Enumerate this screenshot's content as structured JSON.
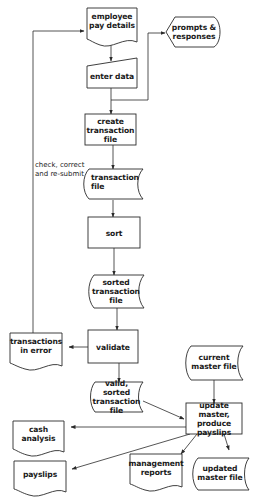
{
  "diagram": {
    "type": "system flowchart",
    "title": "",
    "colors": {
      "stroke": "#2a2a2a",
      "text": "#1a1a1a",
      "background": "#ffffff"
    },
    "nodes": [
      {
        "id": "employee_pay_details",
        "shape": "document",
        "label": "employee pay details"
      },
      {
        "id": "prompts_responses",
        "shape": "display",
        "label": "prompts & responses"
      },
      {
        "id": "enter_data",
        "shape": "manual-input",
        "label": "enter data"
      },
      {
        "id": "create_transaction_file",
        "shape": "process",
        "label": "create transaction file"
      },
      {
        "id": "transaction_file",
        "shape": "stored-data",
        "label": "transaction file"
      },
      {
        "id": "sort",
        "shape": "process",
        "label": "sort"
      },
      {
        "id": "sorted_transaction_file",
        "shape": "stored-data",
        "label": "sorted transaction file"
      },
      {
        "id": "validate",
        "shape": "process",
        "label": "validate"
      },
      {
        "id": "transactions_in_error",
        "shape": "document",
        "label": "transactions in error"
      },
      {
        "id": "current_master_file",
        "shape": "stored-data",
        "label": "current master file"
      },
      {
        "id": "valid_sorted_transaction_file",
        "shape": "stored-data",
        "label": "valid, sorted transaction file"
      },
      {
        "id": "update_master",
        "shape": "process",
        "label": "update master, produce payslips"
      },
      {
        "id": "cash_analysis",
        "shape": "document",
        "label": "cash analysis"
      },
      {
        "id": "payslips",
        "shape": "document",
        "label": "payslips"
      },
      {
        "id": "management_reports",
        "shape": "document",
        "label": "management reports"
      },
      {
        "id": "updated_master_file",
        "shape": "stored-data",
        "label": "updated master file"
      }
    ],
    "edges": [
      {
        "from": "employee_pay_details",
        "to": "enter_data"
      },
      {
        "from": "enter_data",
        "to": "create_transaction_file"
      },
      {
        "from": "create_transaction_file",
        "to": "prompts_responses"
      },
      {
        "from": "create_transaction_file",
        "to": "transaction_file"
      },
      {
        "from": "transaction_file",
        "to": "sort"
      },
      {
        "from": "sort",
        "to": "sorted_transaction_file"
      },
      {
        "from": "sorted_transaction_file",
        "to": "validate"
      },
      {
        "from": "validate",
        "to": "transactions_in_error"
      },
      {
        "from": "validate",
        "to": "valid_sorted_transaction_file"
      },
      {
        "from": "transactions_in_error",
        "to": "employee_pay_details",
        "label": "check, correct and re-submit"
      },
      {
        "from": "valid_sorted_transaction_file",
        "to": "update_master"
      },
      {
        "from": "current_master_file",
        "to": "update_master"
      },
      {
        "from": "update_master",
        "to": "cash_analysis"
      },
      {
        "from": "update_master",
        "to": "payslips"
      },
      {
        "from": "update_master",
        "to": "management_reports"
      },
      {
        "from": "update_master",
        "to": "updated_master_file"
      }
    ]
  },
  "labels": {
    "employee_pay_details": [
      "employee",
      "pay details"
    ],
    "prompts_responses": [
      "prompts &",
      "responses"
    ],
    "enter_data": "enter data",
    "create_transaction_file": [
      "create",
      "transaction",
      "file"
    ],
    "transaction_file": [
      "transaction",
      "file"
    ],
    "sort": "sort",
    "sorted_transaction_file": [
      "sorted",
      "transaction",
      "file"
    ],
    "validate": "validate",
    "transactions_in_error": [
      "transactions",
      "in error"
    ],
    "current_master_file": [
      "current",
      "master file"
    ],
    "valid_sorted_transaction_file": [
      "valid, sorted",
      "transaction",
      "file"
    ],
    "update_master": [
      "update master,",
      "produce",
      "payslips"
    ],
    "cash_analysis": [
      "cash",
      "analysis"
    ],
    "payslips": "payslips",
    "management_reports": [
      "management",
      "reports"
    ],
    "updated_master_file": [
      "updated",
      "master file"
    ],
    "feedback_note": [
      "check, correct",
      "and re-submit"
    ]
  }
}
